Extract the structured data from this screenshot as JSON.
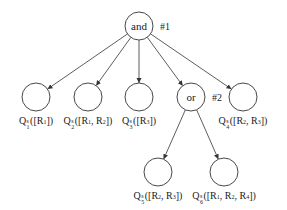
{
  "diagram": {
    "type": "and-or tree",
    "root": {
      "label": "and",
      "tag": "#1",
      "cx": 139,
      "cy": 26
    },
    "or_node": {
      "label": "or",
      "tag": "#2",
      "cx": 191,
      "cy": 97
    },
    "leaves": [
      {
        "id": "q1",
        "q": "Q",
        "sup": "s",
        "sub": "1",
        "args": "([R",
        "argsList": [
          "R1"
        ],
        "text": "Q1s([R1])",
        "cx": 36,
        "cy": 97,
        "parts": [
          [
            "R",
            "1"
          ]
        ]
      },
      {
        "id": "q2",
        "q": "Q",
        "sup": "s",
        "sub": "2",
        "text": "Q2s([R1, R2])",
        "cx": 88,
        "cy": 97,
        "parts": [
          [
            "R",
            "1"
          ],
          [
            "R",
            "2"
          ]
        ]
      },
      {
        "id": "q3",
        "q": "Q",
        "sup": "s",
        "sub": "3",
        "text": "Q3s([R3])",
        "cx": 139,
        "cy": 97,
        "parts": [
          [
            "R",
            "3"
          ]
        ]
      },
      {
        "id": "q4",
        "q": "Q",
        "sup": "s",
        "sub": "4",
        "text": "Q4s([R2, R3])",
        "cx": 243,
        "cy": 97,
        "parts": [
          [
            "R",
            "2"
          ],
          [
            "R",
            "3"
          ]
        ]
      },
      {
        "id": "q5",
        "q": "Q",
        "sup": "s",
        "sub": "5",
        "text": "Q5s([R2, R3])",
        "cx": 158,
        "cy": 172,
        "parts": [
          [
            "R",
            "2"
          ],
          [
            "R",
            "3"
          ]
        ]
      },
      {
        "id": "q6",
        "q": "Q",
        "sup": "s",
        "sub": "6",
        "text": "Q6s([R1, R2, R4])",
        "cx": 224,
        "cy": 172,
        "parts": [
          [
            "R",
            "1"
          ],
          [
            "R",
            "2"
          ],
          [
            "R",
            "4"
          ]
        ]
      }
    ],
    "edges": [
      [
        "root",
        "q1"
      ],
      [
        "root",
        "q2"
      ],
      [
        "root",
        "q3"
      ],
      [
        "root",
        "or"
      ],
      [
        "root",
        "q4"
      ],
      [
        "or",
        "q5"
      ],
      [
        "or",
        "q6"
      ]
    ],
    "colors": {
      "stroke": "#333333",
      "background": "#ffffff",
      "text": "#222222"
    }
  }
}
